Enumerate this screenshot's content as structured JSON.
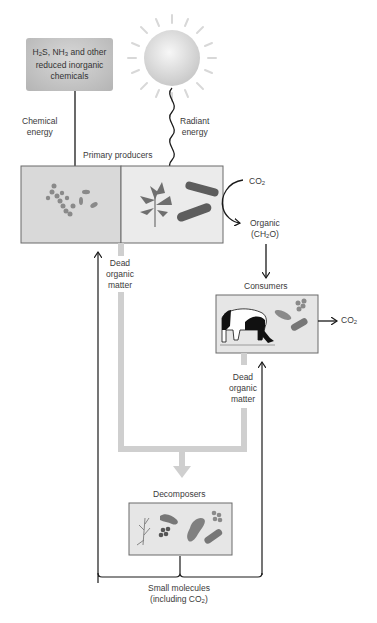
{
  "diagram": {
    "chemical_source": {
      "line1_pre": "H",
      "line1_sub1": "2",
      "line1_mid": "S, NH",
      "line1_sub2": "3",
      "line1_post": " and other",
      "line2": "reduced inorganic",
      "line3": "chemicals"
    },
    "chemical_energy": {
      "line1": "Chemical",
      "line2": "energy"
    },
    "radiant_energy": {
      "line1": "Radiant",
      "line2": "energy"
    },
    "primary_producers": "Primary producers",
    "co2_top": {
      "text": "CO",
      "sub": "2"
    },
    "organic": {
      "line1": "Organic",
      "line2_pre": "(CH",
      "line2_sub": "2",
      "line2_post": "O)"
    },
    "dead_organic_left": {
      "line1": "Dead",
      "line2": "organic",
      "line3": "matter"
    },
    "consumers": "Consumers",
    "co2_right": {
      "text": "CO",
      "sub": "2"
    },
    "dead_organic_right": {
      "line1": "Dead",
      "line2": "organic",
      "line3": "matter"
    },
    "decomposers": "Decomposers",
    "small_molecules": {
      "line1": "Small molecules",
      "line2_pre": "(including CO",
      "line2_sub": "2",
      "line2_post": ")"
    },
    "colors": {
      "box_fill": "#e6e6e6",
      "box_fill_dark": "#d6d6d6",
      "box_stroke": "#666666",
      "organism": "#6e6e6e",
      "flow_band": "#cfcfcf",
      "arrow": "#1a1a1a",
      "sun": "#e0e0e0"
    }
  }
}
